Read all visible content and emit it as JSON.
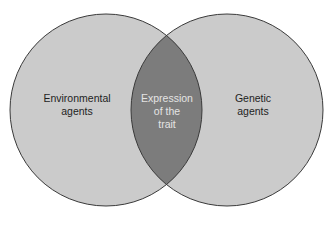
{
  "diagram": {
    "type": "venn",
    "colors": {
      "background": "#ffffff",
      "circle_fill": "#cbcbcb",
      "overlap_fill": "#7c7c7c",
      "outline": "#3a3a3a",
      "label_text": "#1e1e1e",
      "overlap_text": "#e4e4e4"
    },
    "sets": [
      {
        "id": "left",
        "lines": [
          "Environmental",
          "agents"
        ]
      },
      {
        "id": "right",
        "lines": [
          "Genetic",
          "agents"
        ]
      }
    ],
    "intersection": {
      "lines": [
        "Expression",
        "of the",
        "trait"
      ]
    }
  }
}
